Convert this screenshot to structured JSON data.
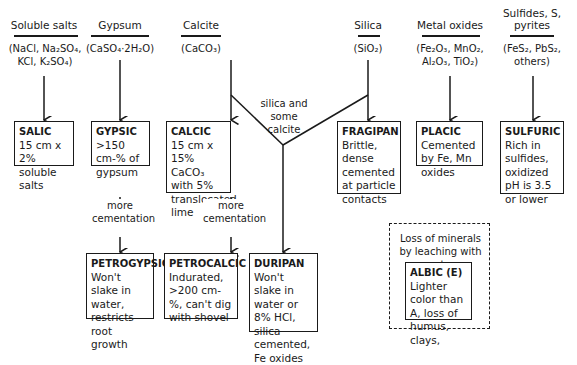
{
  "columns": [
    {
      "header": "Soluble salts",
      "formula": "(NaCl, Na₂SO₄, KCl, K₂SO₄)"
    },
    {
      "header": "Gypsum",
      "formula": "(CaSO₄·2H₂O)"
    },
    {
      "header": "Calcite",
      "formula": "(CaCO₃)"
    },
    {
      "header": "Silica",
      "formula": "(SiO₂)"
    },
    {
      "header": "Metal oxides",
      "formula": "(Fe₂O₃, MnO₂, Al₂O₃, TiO₂)"
    },
    {
      "header": "Sulfides, S, pyrites",
      "formula": "(FeS₂, PbS₂, others)"
    }
  ],
  "boxes": {
    "salic": {
      "name": "SALIC",
      "desc": "15 cm x 2% soluble salts"
    },
    "gypsic": {
      "name": "GYPSIC",
      "desc": ">150 cm-% of gypsum"
    },
    "calcic": {
      "name": "CALCIC",
      "desc": "15 cm x 15% CaCO₃ with 5% translocated lime"
    },
    "fragipan": {
      "name": "FRAGIPAN",
      "desc": "Brittle, dense cemented at particle contacts"
    },
    "placic": {
      "name": "PLACIC",
      "desc": "Cemented by Fe, Mn oxides"
    },
    "sulfuric": {
      "name": "SULFURIC",
      "desc": "Rich in sulfides, oxidized pH is 3.5 or lower"
    },
    "petrogypsic": {
      "name": "PETROGYPSIC",
      "desc": "Won't slake in water, restricts root growth"
    },
    "petrocalcic": {
      "name": "PETROCALCIC",
      "desc": "Indurated, >200 cm-%, can't dig with shovel"
    },
    "duripan": {
      "name": "DURIPAN",
      "desc": "Won't slake in water or 8% HCl, silica cemented, Fe oxides"
    },
    "albic": {
      "name": "ALBIC  (E)",
      "desc": "Lighter color than A, loss of humus, clays,"
    }
  },
  "labels": {
    "silica_calcite": "silica and some calcite",
    "more_cementation_1": "more cementation",
    "more_cementation_2": "more cementation",
    "leaching": "Loss of minerals by leaching with water"
  }
}
